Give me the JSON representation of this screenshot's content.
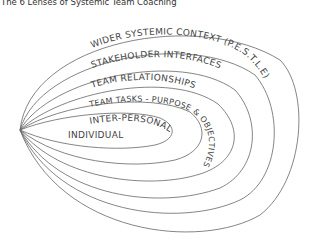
{
  "title": "The 6 Lenses of Systemic Team Coaching",
  "lenses": [
    {
      "label": "WIDER SYSTEMIC CONTEXT (P.E.S.T.L.E)"
    },
    {
      "label": "STAKEHOLDER INTERFACES"
    },
    {
      "label": "TEAM RELATIONSHIPS"
    },
    {
      "label": "TEAM TASKS - PURPOSE & OBJECTIVES"
    },
    {
      "label": "INTER-PERSONAL"
    },
    {
      "label": "INDIVIDUAL"
    }
  ],
  "colors": {
    "line": "#555555",
    "text": "#444444"
  }
}
